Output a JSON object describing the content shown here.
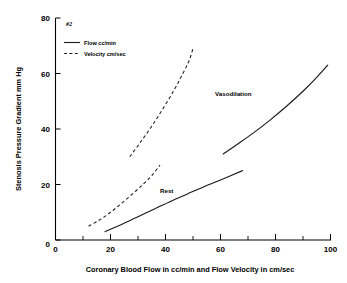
{
  "chart_data": {
    "type": "line",
    "title": "",
    "panel_id": "#2",
    "xlabel": "Coronary Blood Flow in cc/min and Flow Velocity in cm/sec",
    "ylabel": "Stenosis Pressure Gradient mm Hg",
    "xlim": [
      0,
      100
    ],
    "ylim": [
      0,
      80
    ],
    "xticks": [
      0,
      20,
      40,
      60,
      80,
      100
    ],
    "xtick_labels": [
      "0",
      "20",
      "40",
      "60",
      "80",
      "100"
    ],
    "xminor_ticks": [
      10,
      30,
      50,
      70,
      90
    ],
    "yticks": [
      0,
      20,
      40,
      60,
      80
    ],
    "ytick_labels": [
      "0",
      "20",
      "40",
      "60",
      "80"
    ],
    "grid": false,
    "legend_position": "top-left",
    "legend": [
      {
        "label": "Flow cc/min",
        "style": "solid"
      },
      {
        "label": "Velocity cm/sec",
        "style": "dashed"
      }
    ],
    "annotations": [
      {
        "text": "Vasodilation",
        "x": 58,
        "y": 52
      },
      {
        "text": "Rest",
        "x": 38,
        "y": 17
      }
    ],
    "series": [
      {
        "name": "Rest Flow cc/min",
        "style": "solid",
        "condition": "Rest",
        "measure": "Flow cc/min",
        "points": [
          [
            18.0,
            3.0
          ],
          [
            24.0,
            5.6
          ],
          [
            30.0,
            8.4
          ],
          [
            36.0,
            11.2
          ],
          [
            42.0,
            14.0
          ],
          [
            48.0,
            16.6
          ],
          [
            54.0,
            19.2
          ],
          [
            60.0,
            21.6
          ],
          [
            68.0,
            25.0
          ]
        ]
      },
      {
        "name": "Rest Velocity cm/sec",
        "style": "dashed",
        "condition": "Rest",
        "measure": "Velocity cm/sec",
        "points": [
          [
            12.0,
            5.0
          ],
          [
            16.0,
            7.2
          ],
          [
            20.0,
            10.0
          ],
          [
            24.0,
            13.2
          ],
          [
            28.0,
            16.6
          ],
          [
            32.0,
            20.2
          ],
          [
            35.0,
            23.2
          ],
          [
            38.0,
            27.0
          ]
        ]
      },
      {
        "name": "Vasodilation Flow cc/min",
        "style": "solid",
        "condition": "Vasodilation",
        "measure": "Flow cc/min",
        "points": [
          [
            61.0,
            31.0
          ],
          [
            66.0,
            34.4
          ],
          [
            72.0,
            38.6
          ],
          [
            78.0,
            43.2
          ],
          [
            84.0,
            48.2
          ],
          [
            90.0,
            53.6
          ],
          [
            95.0,
            58.6
          ],
          [
            99.0,
            63.0
          ]
        ]
      },
      {
        "name": "Vasodilation Velocity cm/sec",
        "style": "dashed",
        "condition": "Vasodilation",
        "measure": "Velocity cm/sec",
        "points": [
          [
            27.0,
            30.0
          ],
          [
            31.0,
            35.4
          ],
          [
            35.0,
            41.0
          ],
          [
            39.0,
            47.2
          ],
          [
            43.0,
            53.8
          ],
          [
            46.0,
            59.4
          ],
          [
            48.5,
            64.4
          ],
          [
            50.0,
            69.0
          ]
        ]
      }
    ]
  }
}
